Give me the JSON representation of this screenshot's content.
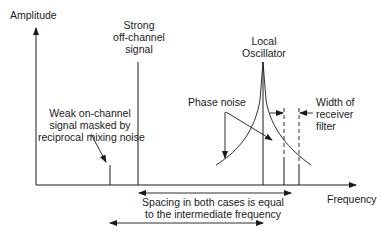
{
  "diagram": {
    "axes": {
      "y_label": "Amplitude",
      "x_label": "Frequency"
    },
    "labels": {
      "strong_signal": [
        "Strong",
        "off-channel",
        "signal"
      ],
      "local_oscillator": [
        "Local",
        "Oscillator"
      ],
      "phase_noise": "Phase noise",
      "filter_width": [
        "Width of",
        "receiver",
        "filter"
      ],
      "weak_signal": [
        "Weak on-channel",
        "signal masked by",
        "reciprocal mixing noise"
      ],
      "spacing": [
        "Spacing in both cases is equal",
        "to the intermediate frequency"
      ]
    },
    "colors": {
      "line": "#1a1a1a",
      "background": "#ffffff"
    }
  }
}
